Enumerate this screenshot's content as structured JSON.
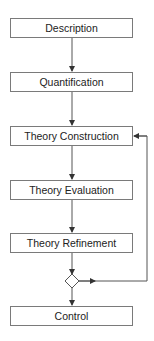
{
  "diagram": {
    "type": "flowchart",
    "nodes": [
      {
        "id": "description",
        "label": "Description"
      },
      {
        "id": "quantification",
        "label": "Quantification"
      },
      {
        "id": "theory_construction",
        "label": "Theory Construction"
      },
      {
        "id": "theory_evaluation",
        "label": "Theory Evaluation"
      },
      {
        "id": "theory_refinement",
        "label": "Theory Refinement"
      },
      {
        "id": "decision",
        "label": ""
      },
      {
        "id": "control",
        "label": "Control"
      }
    ],
    "edges": [
      {
        "from": "description",
        "to": "quantification"
      },
      {
        "from": "quantification",
        "to": "theory_construction"
      },
      {
        "from": "theory_construction",
        "to": "theory_evaluation"
      },
      {
        "from": "theory_evaluation",
        "to": "theory_refinement"
      },
      {
        "from": "theory_refinement",
        "to": "decision"
      },
      {
        "from": "decision",
        "to": "control"
      },
      {
        "from": "decision",
        "to": "theory_construction",
        "kind": "feedback-loop"
      }
    ],
    "colors": {
      "stroke": "#7a7a7a",
      "text": "#222222",
      "background": "#ffffff"
    }
  }
}
